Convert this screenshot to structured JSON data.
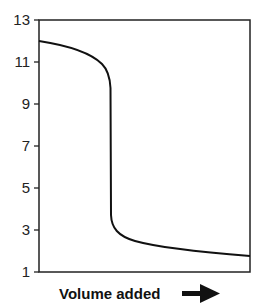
{
  "chart_data": {
    "type": "line",
    "title": "",
    "xlabel": "Volume added",
    "ylabel": "",
    "ylim": [
      1,
      13
    ],
    "yticks": [
      1,
      3,
      5,
      7,
      9,
      11,
      13
    ],
    "grid": false,
    "legend": null,
    "annotations": [
      "arrow pointing right after x-axis label"
    ],
    "series": [
      {
        "name": "titration curve",
        "x": [
          0,
          0.1,
          0.2,
          0.25,
          0.28,
          0.3,
          0.31,
          0.32,
          0.33,
          0.34,
          0.36,
          0.4,
          0.5,
          0.6,
          0.8,
          1.0
        ],
        "values": [
          12.0,
          11.8,
          11.5,
          11.2,
          10.8,
          10.0,
          9.0,
          7.0,
          5.0,
          3.5,
          2.9,
          2.6,
          2.3,
          2.15,
          1.95,
          1.8
        ]
      }
    ]
  },
  "axis": {
    "tick_labels": [
      "13",
      "11",
      "9",
      "7",
      "5",
      "3",
      "1"
    ],
    "xlabel": "Volume added"
  }
}
